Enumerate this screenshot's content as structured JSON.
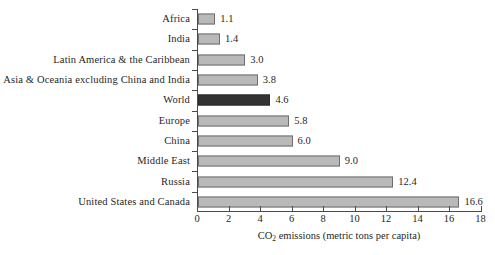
{
  "chart_data": {
    "type": "bar",
    "orientation": "horizontal",
    "title": "",
    "xlabel_parts": {
      "pre": "CO",
      "sub": "2",
      "post": " emissions (metric tons per capita)"
    },
    "xlabel": "CO2 emissions (metric tons per capita)",
    "ylabel": "",
    "xlim": [
      0,
      18
    ],
    "xticks": [
      0,
      2,
      4,
      6,
      8,
      10,
      12,
      14,
      16,
      18
    ],
    "xtick_labels": [
      "0",
      "2",
      "4",
      "6",
      "8",
      "10",
      "12",
      "14",
      "16",
      "18"
    ],
    "grid": false,
    "legend": false,
    "categories": [
      "Africa",
      "India",
      "Latin America & the Caribbean",
      "Asia & Oceania excluding China and India",
      "World",
      "Europe",
      "China",
      "Middle East",
      "Russia",
      "United States and Canada"
    ],
    "values": [
      1.1,
      1.4,
      3.0,
      3.8,
      4.6,
      5.8,
      6.0,
      9.0,
      12.4,
      16.6
    ],
    "value_labels": [
      "1.1",
      "1.4",
      "3.0",
      "3.8",
      "4.6",
      "5.8",
      "6.0",
      "9.0",
      "12.4",
      "16.6"
    ],
    "highlight_category": "World",
    "colors": {
      "bar_fill": "#b9b9b9",
      "bar_stroke": "#6e6e6e",
      "highlight_fill": "#333333",
      "highlight_stroke": "#2a2a2a",
      "axis": "#4a4a4a",
      "text": "#1f1f1f",
      "background": "#ffffff"
    }
  }
}
